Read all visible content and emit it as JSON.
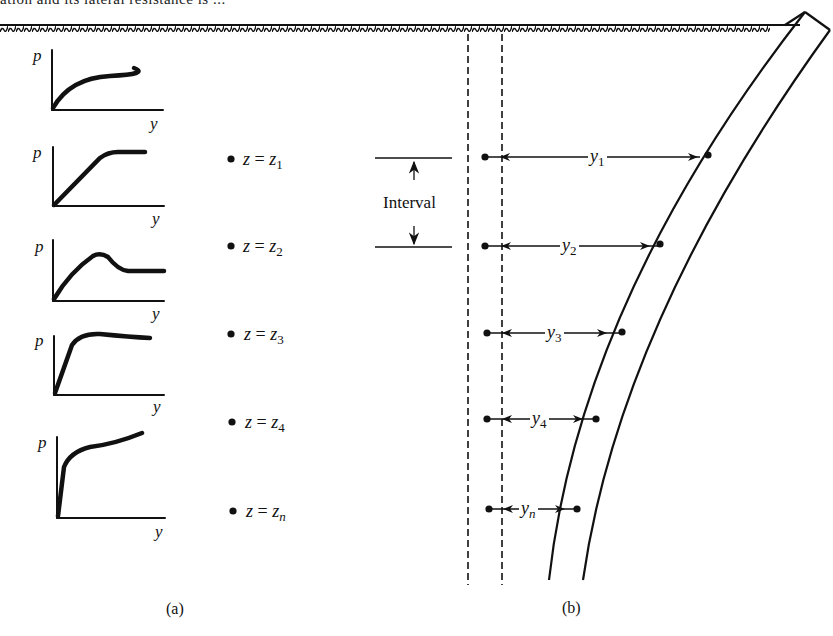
{
  "header": {
    "partial_text": "ation and its lateral resistance is ..."
  },
  "panel_a": {
    "caption": "(a)",
    "axis_labels": {
      "vertical": "p",
      "horizontal": "y"
    },
    "curves": [
      {
        "id": 1,
        "shape": "concave-increasing",
        "depth_label": ""
      },
      {
        "id": 2,
        "shape": "linear-then-plateau",
        "depth_label": "z = z1"
      },
      {
        "id": 3,
        "shape": "peak-then-softening",
        "depth_label": "z = z2"
      },
      {
        "id": 4,
        "shape": "steep-rise-then-flat",
        "depth_label": "z = z3"
      },
      {
        "id": 5,
        "shape": "very-steep-rise-then-gradual-increase",
        "depth_label": "z = z4"
      }
    ],
    "depth_points": [
      {
        "var": "z",
        "eq": "=",
        "base": "z",
        "sub": "1"
      },
      {
        "var": "z",
        "eq": "=",
        "base": "z",
        "sub": "2"
      },
      {
        "var": "z",
        "eq": "=",
        "base": "z",
        "sub": "3"
      },
      {
        "var": "z",
        "eq": "=",
        "base": "z",
        "sub": "4"
      },
      {
        "var": "z",
        "eq": "=",
        "base": "z",
        "sub": "n"
      }
    ]
  },
  "panel_b": {
    "caption": "(b)",
    "interval_label": "Interval",
    "deflections": [
      {
        "base": "y",
        "sub": "1"
      },
      {
        "base": "y",
        "sub": "2"
      },
      {
        "base": "y",
        "sub": "3"
      },
      {
        "base": "y",
        "sub": "4"
      },
      {
        "base": "y",
        "sub": "n"
      }
    ],
    "elements": {
      "ground_surface": "hatched ground line",
      "original_pile_axis": "dashed vertical lines",
      "deflected_pile": "curved pile shape"
    }
  },
  "colors": {
    "ink": "#111111",
    "background": "#ffffff"
  }
}
